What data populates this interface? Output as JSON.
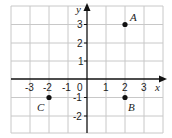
{
  "diagram": {
    "type": "coordinate-plane",
    "axes": {
      "x_label": "x",
      "y_label": "y"
    },
    "x_range": [
      -4,
      4
    ],
    "y_range": [
      -3,
      4
    ],
    "x_ticks": [
      "-3",
      "-2",
      "-1",
      "0",
      "1",
      "2",
      "3"
    ],
    "y_ticks": [
      "3",
      "2",
      "1",
      "-1",
      "-2"
    ],
    "points": [
      {
        "label": "A",
        "x": 2,
        "y": 3
      },
      {
        "label": "B",
        "x": 2,
        "y": -1
      },
      {
        "label": "C",
        "x": -2,
        "y": -1
      }
    ],
    "colors": {
      "grid": "#c8c8c8",
      "axis": "#111111",
      "point": "#111111"
    }
  }
}
